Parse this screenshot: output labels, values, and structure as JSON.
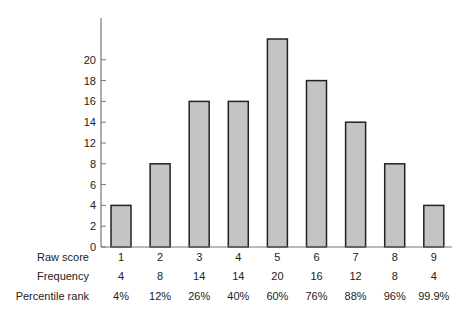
{
  "chart_data": {
    "type": "bar",
    "title": "",
    "xlabel": "Raw score",
    "ylabel": "Frequency",
    "categories": [
      "1",
      "2",
      "3",
      "4",
      "5",
      "6",
      "7",
      "8",
      "9"
    ],
    "values": [
      4,
      8,
      14,
      14,
      20,
      16,
      12,
      8,
      4
    ],
    "ylim": [
      0,
      22
    ],
    "y_tick_labels": [
      "0",
      "2",
      "4",
      "6",
      "8",
      "12",
      "14",
      "16",
      "18",
      "20"
    ],
    "grid": false,
    "bar_color": "#c4c4c4",
    "bar_edge_color": "#222222",
    "table": {
      "rows": [
        {
          "label": "Raw score",
          "values": [
            "1",
            "2",
            "3",
            "4",
            "5",
            "6",
            "7",
            "8",
            "9"
          ]
        },
        {
          "label": "Frequency",
          "values": [
            "4",
            "8",
            "14",
            "14",
            "20",
            "16",
            "12",
            "8",
            "4"
          ]
        },
        {
          "label": "Percentile rank",
          "values": [
            "4%",
            "12%",
            "26%",
            "40%",
            "60%",
            "76%",
            "88%",
            "96%",
            "99.9%"
          ]
        }
      ]
    }
  }
}
